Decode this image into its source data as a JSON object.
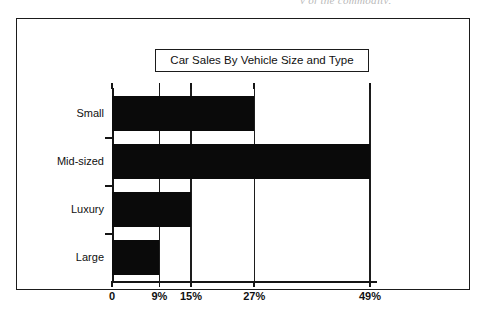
{
  "page": {
    "scan_remnant_text": "y of the commodity,"
  },
  "figure": {
    "title": "Car Sales By Vehicle Size and Type"
  },
  "chart_data": {
    "type": "bar",
    "orientation": "horizontal",
    "title": "Car Sales By Vehicle Size and Type",
    "xlabel": "",
    "ylabel": "",
    "categories": [
      "Small",
      "Mid-sized",
      "Luxury",
      "Large"
    ],
    "values": [
      27,
      49,
      15,
      9
    ],
    "value_labels": [
      "27%",
      "49%",
      "15%",
      "9%"
    ],
    "xlim": [
      0,
      49
    ],
    "xticks": [
      0,
      9,
      15,
      27,
      49
    ],
    "xtick_labels": [
      "0",
      "9%",
      "15%",
      "27%",
      "49%"
    ],
    "grid": true,
    "grid_axis": "x",
    "legend": false,
    "bar_color": "#0a0a0a",
    "background_color": "#ffffff",
    "axis_color": "#151515"
  }
}
